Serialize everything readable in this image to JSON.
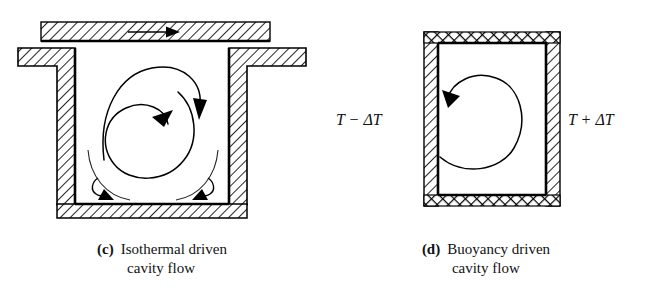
{
  "figure": {
    "panels": [
      {
        "tag": "(c)",
        "title_line1": "Isothermal driven",
        "title_line2": "cavity flow",
        "walls": {
          "lid": "moving-lid-hatched-bar",
          "left_wall": "hatched-l-shape",
          "right_wall": "hatched-l-shape",
          "bottom_wall": "hatched-slab"
        },
        "annotations": {
          "lid_motion_arrow": "rightward",
          "primary_vortex": "clockwise-spiral",
          "corner_vortices": 2
        }
      },
      {
        "tag": "(d)",
        "title_line1": "Buoyancy driven",
        "title_line2": "cavity flow",
        "labels": {
          "cold_wall": "T − ΔT",
          "hot_wall": "T + ΔT"
        },
        "walls": {
          "top": "cross-hatched-adiabatic",
          "bottom": "cross-hatched-adiabatic",
          "left": "hatched-isothermal",
          "right": "hatched-isothermal"
        },
        "annotations": {
          "primary_vortex": "counter-clockwise-loop"
        }
      }
    ],
    "colors": {
      "ink": "#000000",
      "background": "#ffffff"
    }
  }
}
